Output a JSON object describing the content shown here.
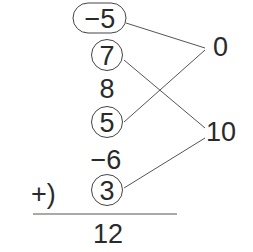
{
  "terms": [
    {
      "id": "t1",
      "text": "−5",
      "marker": "pill"
    },
    {
      "id": "t2",
      "text": "7",
      "marker": "circle"
    },
    {
      "id": "t3",
      "text": "8",
      "marker": "none"
    },
    {
      "id": "t4",
      "text": "5",
      "marker": "circle"
    },
    {
      "id": "t5",
      "text": "−6",
      "marker": "none"
    },
    {
      "id": "t6",
      "text": "3",
      "marker": "circle"
    }
  ],
  "operator": "+)",
  "result": "12",
  "groups": [
    {
      "id": "g1",
      "text": "0",
      "pairs": [
        "−5",
        "5"
      ]
    },
    {
      "id": "g2",
      "text": "10",
      "pairs": [
        "7",
        "3"
      ]
    }
  ],
  "colors": {
    "ink": "#2a2a2a",
    "line": "#555555"
  }
}
